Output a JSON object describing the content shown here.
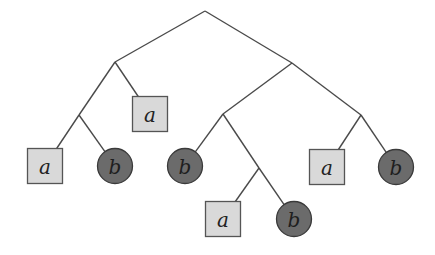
{
  "diagram": {
    "type": "binary-tree",
    "colors": {
      "edge": "#4a4a4a",
      "square_fill": "#d9d9d9",
      "square_stroke": "#555555",
      "circle_fill": "#6b6b6b",
      "circle_stroke": "#3a3a3a"
    },
    "internal_nodes": [
      {
        "id": "root",
        "x": 205,
        "y": 11
      },
      {
        "id": "n1",
        "x": 115,
        "y": 62
      },
      {
        "id": "n2",
        "x": 79,
        "y": 115
      },
      {
        "id": "n3",
        "x": 292,
        "y": 63
      },
      {
        "id": "n4",
        "x": 223,
        "y": 114
      },
      {
        "id": "n5",
        "x": 259,
        "y": 168
      },
      {
        "id": "n6",
        "x": 361,
        "y": 115
      }
    ],
    "leaves": [
      {
        "id": "l1",
        "shape": "square",
        "label": "a",
        "x": 45,
        "y": 166
      },
      {
        "id": "l2",
        "shape": "circle",
        "label": "b",
        "x": 115,
        "y": 166
      },
      {
        "id": "l3",
        "shape": "square",
        "label": "a",
        "x": 150,
        "y": 114
      },
      {
        "id": "l4",
        "shape": "circle",
        "label": "b",
        "x": 185,
        "y": 166
      },
      {
        "id": "l5",
        "shape": "square",
        "label": "a",
        "x": 223,
        "y": 219
      },
      {
        "id": "l6",
        "shape": "circle",
        "label": "b",
        "x": 294,
        "y": 219
      },
      {
        "id": "l7",
        "shape": "square",
        "label": "a",
        "x": 327,
        "y": 167
      },
      {
        "id": "l8",
        "shape": "circle",
        "label": "b",
        "x": 396,
        "y": 167
      }
    ],
    "edges": [
      {
        "from": "root",
        "to": "n1"
      },
      {
        "from": "root",
        "to": "n3"
      },
      {
        "from": "n1",
        "to": "n2"
      },
      {
        "from": "n1",
        "to": "l3"
      },
      {
        "from": "n2",
        "to": "l1"
      },
      {
        "from": "n2",
        "to": "l2"
      },
      {
        "from": "n3",
        "to": "n4"
      },
      {
        "from": "n3",
        "to": "n6"
      },
      {
        "from": "n4",
        "to": "l4"
      },
      {
        "from": "n4",
        "to": "n5"
      },
      {
        "from": "n5",
        "to": "l5"
      },
      {
        "from": "n5",
        "to": "l6"
      },
      {
        "from": "n6",
        "to": "l7"
      },
      {
        "from": "n6",
        "to": "l8"
      }
    ]
  }
}
